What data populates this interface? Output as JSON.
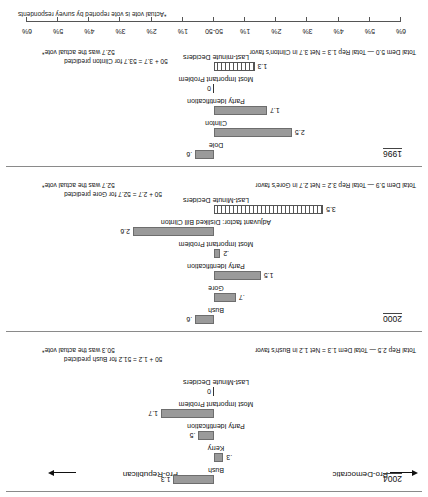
{
  "chart_data": {
    "type": "bar",
    "title": "",
    "subtitle": "",
    "note": "*Actual vote is vote reported by survey respondents",
    "xlabel": "",
    "ylabel": "",
    "axis": {
      "center_label": "50-50",
      "tick_labels_left": [
        "6%",
        "5%",
        "4%",
        "3%",
        "2%",
        "1%"
      ],
      "tick_labels_right": [
        "1%",
        "2%",
        "3%",
        "4%",
        "5%",
        "6%"
      ],
      "direction_left": "Pro-Democratic",
      "direction_right": "Pro-Republican",
      "xlim": [
        -6,
        6
      ],
      "grid": false
    },
    "legend_position": "none",
    "panels": [
      {
        "year": "1996",
        "items": [
          {
            "label": "Dole",
            "value": 0.6,
            "value_label": ".6",
            "side": "republican",
            "style": "solid"
          },
          {
            "label": "Clinton",
            "value": 2.5,
            "value_label": "2.5",
            "side": "democratic",
            "style": "solid"
          },
          {
            "label": "Party Identification",
            "value": 1.7,
            "value_label": "1.7",
            "side": "democratic",
            "style": "solid"
          },
          {
            "label": "Most Important Problem",
            "value": 0,
            "value_label": "0",
            "side": "democratic",
            "style": "zero"
          },
          {
            "label": "Last-minute Deciders",
            "value": 1.3,
            "value_label": "1.3",
            "side": "democratic",
            "style": "hatched"
          }
        ],
        "net_text": "Total Dem 5.0 — Total Rep 1.3 = Net 3.7 in Clinton's favor",
        "predicted_line1": "50 + 3.7 = 53.7 for Clinton predicted",
        "predicted_line2": "52.7 was the actual vote*"
      },
      {
        "year": "2000",
        "items": [
          {
            "label": "Bush",
            "value": 0.6,
            "value_label": ".6",
            "side": "republican",
            "style": "solid"
          },
          {
            "label": "Gore",
            "value": 0.7,
            "value_label": ".7",
            "side": "democratic",
            "style": "solid"
          },
          {
            "label": "Party Identification",
            "value": 1.5,
            "value_label": "1.5",
            "side": "democratic",
            "style": "solid"
          },
          {
            "label": "Most Important Problem",
            "value": 0.2,
            "value_label": ".2",
            "side": "democratic",
            "style": "solid"
          },
          {
            "label": "Adjuvant factor:  Disliked Bill Clinton",
            "value": 2.6,
            "value_label": "2.6",
            "side": "republican",
            "style": "solid"
          },
          {
            "label": "Last-Minute Deciders",
            "value": 3.5,
            "value_label": "3.5",
            "side": "democratic",
            "style": "hatched"
          }
        ],
        "net_text": "Total Dem 5.9 — Total Rep 3.2 = Net 2.7 in Gore's favor",
        "predicted_line1": "50 + 2.7 = 52.7 for Gore predicted",
        "predicted_line2": "52.7 was the actual vote*"
      },
      {
        "year": "2004",
        "items": [
          {
            "label": "Bush",
            "value": 1.3,
            "value_label": "1.3",
            "side": "republican",
            "style": "solid"
          },
          {
            "label": "Kerry",
            "value": 0.3,
            "value_label": ".3",
            "side": "democratic",
            "style": "solid"
          },
          {
            "label": "Party Identification",
            "value": 0.5,
            "value_label": ".5",
            "side": "republican",
            "style": "solid"
          },
          {
            "label": "Most Important Problem",
            "value": 1.7,
            "value_label": "1.7",
            "side": "republican",
            "style": "solid"
          },
          {
            "label": "Last-Minute Deciders",
            "value": 0,
            "value_label": "0",
            "side": "democratic",
            "style": "zero"
          }
        ],
        "net_text": "Total Rep 2.5 — Total Dem 1.3 = Net 1.2 in Bush's favor",
        "predicted_line1": "50 + 1.2 = 51.2 for Bush predicted",
        "predicted_line2": "50.3 was the actual vote*"
      }
    ]
  }
}
